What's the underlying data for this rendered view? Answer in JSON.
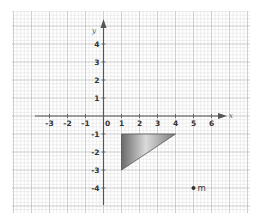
{
  "chart_data": {
    "type": "scatter",
    "title": "",
    "xlabel": "x",
    "ylabel": "y",
    "xlim": [
      -3.5,
      6.5
    ],
    "ylim": [
      -4.5,
      4.5
    ],
    "grid": true,
    "x_ticks": [
      "-3",
      "-2",
      "-1",
      "0",
      "1",
      "2",
      "3",
      "4",
      "5",
      "6"
    ],
    "x_tick_values": [
      -3,
      -2,
      -1,
      0,
      1,
      2,
      3,
      4,
      5,
      6
    ],
    "y_ticks": [
      "4",
      "3",
      "2",
      "1",
      "-1",
      "-2",
      "-3",
      "-4"
    ],
    "y_tick_values": [
      4,
      3,
      2,
      1,
      -1,
      -2,
      -3,
      -4
    ],
    "shapes": [
      {
        "type": "triangle",
        "vertices": [
          [
            1,
            -1
          ],
          [
            4,
            -1
          ],
          [
            1,
            -3
          ]
        ],
        "fill": "gradient-gray"
      }
    ],
    "points": [
      {
        "label": "m",
        "x": 5,
        "y": -4
      }
    ]
  },
  "labels": {
    "x_axis": "x",
    "y_axis": "y",
    "point_m": "m"
  },
  "colors": {
    "grid_minor": "#dcdcdc",
    "grid_major": "#b8b8b8",
    "axis": "#555555",
    "triangle_dark": "#6e6e6e",
    "triangle_light": "#d8d8d8"
  }
}
